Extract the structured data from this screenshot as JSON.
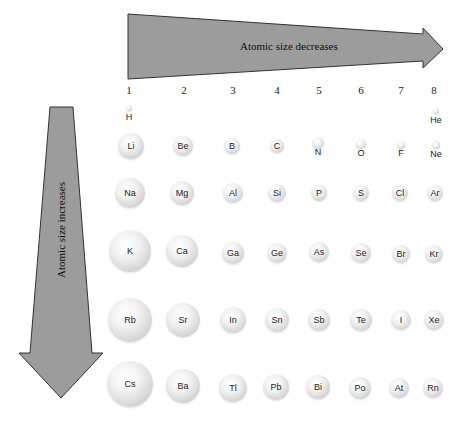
{
  "diagram": {
    "title_horizontal": "Atomic size decreases",
    "title_vertical": "Atomic size increases",
    "arrow_color": "#9c9c9c",
    "arrow_outline": "#333333",
    "groups": [
      {
        "label": "1",
        "x": 129
      },
      {
        "label": "2",
        "x": 184
      },
      {
        "label": "3",
        "x": 233
      },
      {
        "label": "4",
        "x": 277
      },
      {
        "label": "5",
        "x": 319
      },
      {
        "label": "6",
        "x": 361
      },
      {
        "label": "7",
        "x": 401
      },
      {
        "label": "8",
        "x": 434
      }
    ],
    "atoms": [
      {
        "symbol": "H",
        "x": 129,
        "y": 108,
        "r": 3,
        "label_below": true,
        "label_y": 117
      },
      {
        "symbol": "He",
        "x": 436,
        "y": 111,
        "r": 3,
        "label_below": true,
        "label_y": 120
      },
      {
        "symbol": "Li",
        "x": 131,
        "y": 146,
        "r": 13
      },
      {
        "symbol": "Be",
        "x": 183,
        "y": 146,
        "r": 10
      },
      {
        "symbol": "B",
        "x": 232,
        "y": 146,
        "r": 8
      },
      {
        "symbol": "C",
        "x": 277,
        "y": 146,
        "r": 7
      },
      {
        "symbol": "N",
        "x": 318,
        "y": 143,
        "r": 6,
        "label_below": true,
        "label_y": 152
      },
      {
        "symbol": "O",
        "x": 361,
        "y": 144,
        "r": 5,
        "label_below": true,
        "label_y": 153
      },
      {
        "symbol": "F",
        "x": 401,
        "y": 145,
        "r": 4,
        "label_below": true,
        "label_y": 153
      },
      {
        "symbol": "Ne",
        "x": 436,
        "y": 145,
        "r": 4,
        "label_below": true,
        "label_y": 154
      },
      {
        "symbol": "Na",
        "x": 130,
        "y": 193,
        "r": 15
      },
      {
        "symbol": "Mg",
        "x": 182,
        "y": 193,
        "r": 12
      },
      {
        "symbol": "Al",
        "x": 233,
        "y": 193,
        "r": 10
      },
      {
        "symbol": "Si",
        "x": 277,
        "y": 193,
        "r": 9
      },
      {
        "symbol": "P",
        "x": 319,
        "y": 193,
        "r": 8
      },
      {
        "symbol": "S",
        "x": 361,
        "y": 193,
        "r": 8
      },
      {
        "symbol": "Cl",
        "x": 400,
        "y": 193,
        "r": 8
      },
      {
        "symbol": "Ar",
        "x": 435,
        "y": 193,
        "r": 8
      },
      {
        "symbol": "K",
        "x": 130,
        "y": 251,
        "r": 21
      },
      {
        "symbol": "Ca",
        "x": 182,
        "y": 251,
        "r": 16
      },
      {
        "symbol": "Ga",
        "x": 233,
        "y": 253,
        "r": 11
      },
      {
        "symbol": "Ge",
        "x": 277,
        "y": 253,
        "r": 10
      },
      {
        "symbol": "As",
        "x": 319,
        "y": 252,
        "r": 10
      },
      {
        "symbol": "Se",
        "x": 361,
        "y": 253,
        "r": 10
      },
      {
        "symbol": "Br",
        "x": 401,
        "y": 254,
        "r": 9
      },
      {
        "symbol": "Kr",
        "x": 434,
        "y": 254,
        "r": 9
      },
      {
        "symbol": "Rb",
        "x": 130,
        "y": 320,
        "r": 22
      },
      {
        "symbol": "Sr",
        "x": 183,
        "y": 320,
        "r": 17
      },
      {
        "symbol": "In",
        "x": 233,
        "y": 320,
        "r": 13
      },
      {
        "symbol": "Sn",
        "x": 277,
        "y": 320,
        "r": 12
      },
      {
        "symbol": "Sb",
        "x": 319,
        "y": 320,
        "r": 11
      },
      {
        "symbol": "Te",
        "x": 361,
        "y": 320,
        "r": 11
      },
      {
        "symbol": "I",
        "x": 401,
        "y": 320,
        "r": 10
      },
      {
        "symbol": "Xe",
        "x": 434,
        "y": 320,
        "r": 10
      },
      {
        "symbol": "Cs",
        "x": 130,
        "y": 384,
        "r": 23
      },
      {
        "symbol": "Ba",
        "x": 183,
        "y": 386,
        "r": 17
      },
      {
        "symbol": "Tl",
        "x": 233,
        "y": 388,
        "r": 14
      },
      {
        "symbol": "Pb",
        "x": 276,
        "y": 387,
        "r": 13
      },
      {
        "symbol": "Bi",
        "x": 318,
        "y": 387,
        "r": 12
      },
      {
        "symbol": "Po",
        "x": 360,
        "y": 388,
        "r": 11
      },
      {
        "symbol": "At",
        "x": 399,
        "y": 388,
        "r": 10
      },
      {
        "symbol": "Rn",
        "x": 433,
        "y": 388,
        "r": 10
      }
    ]
  }
}
